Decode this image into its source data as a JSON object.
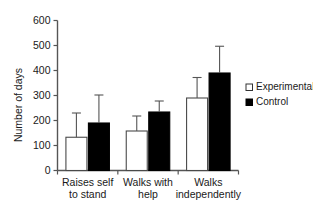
{
  "chart_data": {
    "type": "bar",
    "title": "",
    "subtitle": "",
    "xlabel": "",
    "ylabel": "Number of days",
    "ylim": [
      0,
      600
    ],
    "yticks": [
      0,
      100,
      200,
      300,
      400,
      500,
      600
    ],
    "ytick_labels": [
      "0",
      "100",
      "200",
      "300",
      "400",
      "500",
      "600"
    ],
    "grid": false,
    "legend_position": "right",
    "categories": [
      "Raises self to stand",
      "Walks with help",
      "Walks independently"
    ],
    "category_lines": [
      [
        "Raises self",
        "to stand"
      ],
      [
        "Walks with",
        "help"
      ],
      [
        "Walks",
        "independently"
      ]
    ],
    "series": [
      {
        "name": "Experimental",
        "color": "#ffffff",
        "edge_color": "#4a4a4a",
        "style": "open",
        "values": [
          133,
          158,
          290
        ],
        "error_high": [
          230,
          218,
          372
        ]
      },
      {
        "name": "Control",
        "color": "#000000",
        "edge_color": "#000000",
        "style": "filled",
        "values": [
          190,
          234,
          390
        ],
        "error_high": [
          302,
          278,
          497
        ]
      }
    ]
  },
  "legend": {
    "items": [
      {
        "label": "Experimental",
        "marker": "open-square-marker"
      },
      {
        "label": "Control",
        "marker": "filled-square-marker"
      }
    ]
  },
  "axes": {
    "y_title": "Number of days"
  }
}
